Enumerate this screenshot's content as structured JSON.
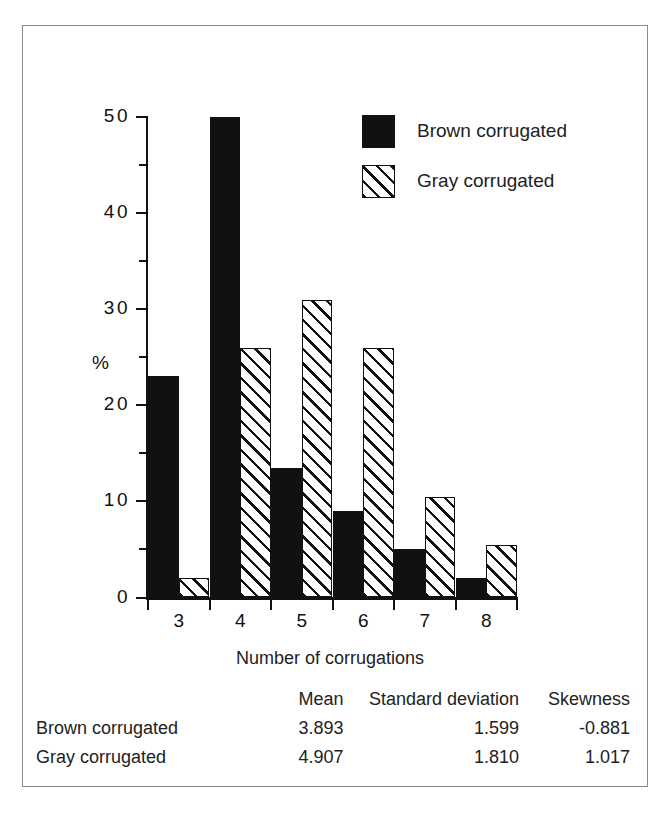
{
  "chart_data": {
    "type": "bar",
    "title": "",
    "xlabel": "Number of corrugations",
    "ylabel": "%",
    "categories": [
      "3",
      "4",
      "5",
      "6",
      "7",
      "8"
    ],
    "series": [
      {
        "name": "Brown corrugated",
        "pattern": "solid",
        "color": "#111111",
        "values": [
          23,
          50,
          13.5,
          9,
          5,
          2
        ]
      },
      {
        "name": "Gray corrugated",
        "pattern": "hatched",
        "color": "#ffffff",
        "values": [
          2,
          26,
          31,
          26,
          10.5,
          5.5
        ]
      }
    ],
    "ylim": [
      0,
      50
    ],
    "yticks_major": [
      0,
      10,
      20,
      30,
      40,
      50
    ],
    "ytick_labels": [
      "0",
      "10",
      "20",
      "30",
      "40",
      "50"
    ],
    "yticks_minor": [
      5,
      15,
      25,
      35,
      45
    ],
    "grid": false,
    "legend_position": "top-right"
  },
  "legend": {
    "entries": [
      {
        "label": "Brown corrugated",
        "swatch": "solid-black-square"
      },
      {
        "label": "Gray corrugated",
        "swatch": "diagonal-hatched-square"
      }
    ]
  },
  "stats_table": {
    "columns": [
      "",
      "Mean",
      "Standard deviation",
      "Skewness"
    ],
    "rows": [
      {
        "name": "Brown corrugated",
        "mean": "3.893",
        "sd": "1.599",
        "skewness": "-0.881"
      },
      {
        "name": "Gray corrugated",
        "mean": "4.907",
        "sd": "1.810",
        "skewness": "1.017"
      }
    ]
  },
  "colors": {
    "ink": "#111111",
    "frame": "#8a8a8a",
    "paper": "#ffffff"
  }
}
